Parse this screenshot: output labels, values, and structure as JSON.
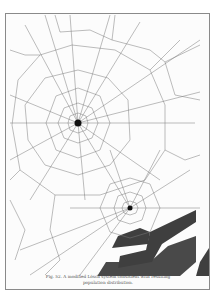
{
  "figure": {
    "caption_line1": "Fig. 52. A modified Lösch system consistent with resulting",
    "caption_line2": "population distribution.",
    "centers": [
      {
        "name": "primary-center",
        "x": 78,
        "y": 123
      },
      {
        "name": "secondary-center",
        "x": 130,
        "y": 208
      }
    ],
    "colors": {
      "line": "#7a7a7a",
      "band": "#3f3f3f",
      "border": "#8a8a8a"
    }
  }
}
